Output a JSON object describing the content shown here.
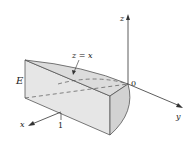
{
  "figure": {
    "solid_label": "E",
    "surface_label": "z = x",
    "origin_label": "0",
    "axes": {
      "x": "x",
      "y": "y",
      "z": "z"
    },
    "tick_x": "1",
    "colors": {
      "solid_fill": "#e6e6e6",
      "solid_top": "#dedede",
      "curved_face": "#d4d4d4",
      "edge": "#555555",
      "axis": "#333333"
    }
  }
}
